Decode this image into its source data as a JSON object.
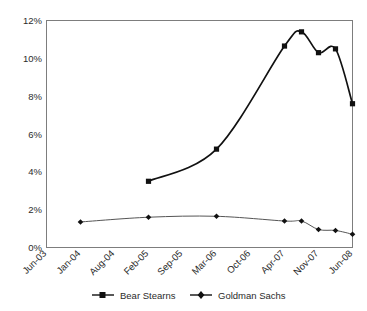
{
  "chart_data": {
    "type": "line",
    "title": "",
    "subtitle": "",
    "xlabel": "",
    "ylabel": "",
    "grid": false,
    "legend_position": "bottom",
    "categories": [
      "Jun-03",
      "Jan-04",
      "Aug-04",
      "Feb-05",
      "Sep-05",
      "Mar-06",
      "Oct-06",
      "Apr-07",
      "Nov-07",
      "Jun-08"
    ],
    "x_tick_labels": [
      "Jun-03",
      "Jan-04",
      "Aug-04",
      "Feb-05",
      "Sep-05",
      "Mar-06",
      "Oct-06",
      "Apr-07",
      "Nov-07",
      "Jun-08"
    ],
    "y_tick_labels": [
      "0%",
      "2%",
      "4%",
      "6%",
      "8%",
      "10%",
      "12%"
    ],
    "y_tick_values": [
      0,
      2,
      4,
      6,
      8,
      10,
      12
    ],
    "ylim": [
      0,
      12
    ],
    "xlim": [
      0,
      9
    ],
    "series": [
      {
        "name": "Bear Stearns",
        "marker": "square",
        "x": [
          3,
          5,
          7,
          7.5,
          8,
          8.5,
          9
        ],
        "values": [
          3.5,
          5.2,
          10.65,
          11.4,
          10.3,
          10.5,
          7.6
        ],
        "point_labels": [
          "Feb-05",
          "Mar-06",
          "Apr-07",
          "",
          "Nov-07",
          "",
          "Jun-08"
        ]
      },
      {
        "name": "Goldman Sachs",
        "marker": "diamond",
        "x": [
          1,
          3,
          5,
          7,
          7.5,
          8,
          8.5,
          9
        ],
        "values": [
          1.35,
          1.6,
          1.65,
          1.4,
          1.4,
          0.95,
          0.9,
          0.7
        ],
        "point_labels": [
          "Jan-04",
          "Feb-05",
          "Mar-06",
          "Apr-07",
          "",
          "Nov-07",
          "",
          "Jun-08"
        ]
      }
    ]
  },
  "legend": {
    "items": [
      {
        "label": "Bear Stearns",
        "marker": "square"
      },
      {
        "label": "Goldman Sachs",
        "marker": "diamond"
      }
    ]
  },
  "axes": {
    "y_labels": [
      "12%",
      "10%",
      "8%",
      "6%",
      "4%",
      "2%",
      "0%"
    ],
    "x_labels": [
      "Jun-03",
      "Jan-04",
      "Aug-04",
      "Feb-05",
      "Sep-05",
      "Mar-06",
      "Oct-06",
      "Apr-07",
      "Nov-07",
      "Jun-08"
    ]
  }
}
